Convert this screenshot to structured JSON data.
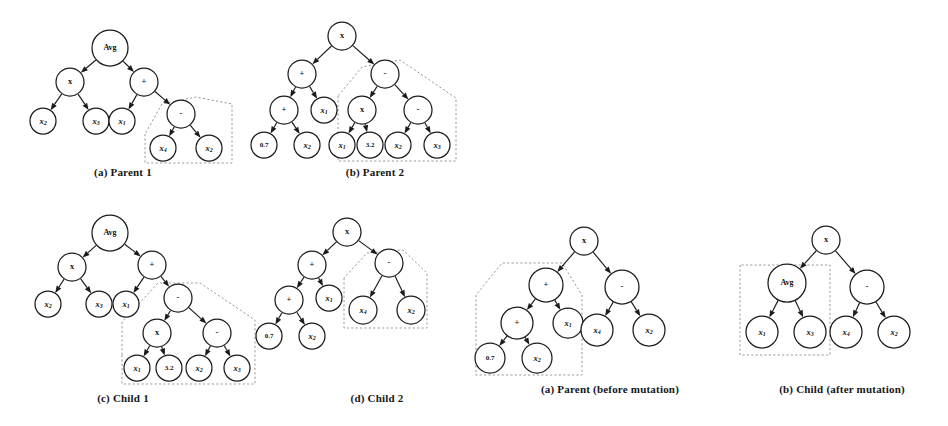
{
  "figures": [
    {
      "id": "parent-1",
      "caption": "(a) Parent 1",
      "caption_x": 58,
      "caption_y": 166,
      "caption_w": 130,
      "x": 0,
      "y": 0,
      "w": 250,
      "h": 165,
      "nodes": [
        {
          "id": "n0",
          "label": "Avg",
          "kind": "word",
          "cx": 110,
          "cy": 48,
          "r": 18
        },
        {
          "id": "n1",
          "label": "x",
          "kind": "op",
          "cx": 70,
          "cy": 82,
          "r": 14
        },
        {
          "id": "n2",
          "label": "+",
          "kind": "op",
          "cx": 144,
          "cy": 82,
          "r": 14
        },
        {
          "id": "n3",
          "label": "x",
          "sub": "2",
          "kind": "var",
          "cx": 43,
          "cy": 121,
          "r": 13
        },
        {
          "id": "n4",
          "label": "x",
          "sub": "3",
          "kind": "var",
          "cx": 96,
          "cy": 121,
          "r": 13
        },
        {
          "id": "n5",
          "label": "x",
          "sub": "1",
          "kind": "var",
          "cx": 122,
          "cy": 121,
          "r": 13
        },
        {
          "id": "n6",
          "label": "-",
          "kind": "op",
          "cx": 181,
          "cy": 114,
          "r": 14
        },
        {
          "id": "n7",
          "label": "x",
          "sub": "4",
          "kind": "var",
          "cx": 163,
          "cy": 148,
          "r": 13
        },
        {
          "id": "n8",
          "label": "x",
          "sub": "2",
          "kind": "var",
          "cx": 209,
          "cy": 148,
          "r": 13
        }
      ],
      "edges": [
        [
          "n0",
          "n1"
        ],
        [
          "n0",
          "n2"
        ],
        [
          "n1",
          "n3"
        ],
        [
          "n1",
          "n4"
        ],
        [
          "n2",
          "n5"
        ],
        [
          "n2",
          "n6"
        ],
        [
          "n6",
          "n7"
        ],
        [
          "n6",
          "n8"
        ]
      ],
      "dashed": [
        {
          "points": "145,134 145,163 232,163 232,104 196,97 162,104 145,134"
        }
      ]
    },
    {
      "id": "parent-2",
      "caption": "(b) Parent 2",
      "caption_x": 310,
      "caption_y": 166,
      "caption_w": 130,
      "x": 250,
      "y": 0,
      "w": 250,
      "h": 165,
      "nodes": [
        {
          "id": "n0",
          "label": "x",
          "kind": "op",
          "cx": 92,
          "cy": 36,
          "r": 14
        },
        {
          "id": "n1",
          "label": "+",
          "kind": "op",
          "cx": 52,
          "cy": 74,
          "r": 14
        },
        {
          "id": "n2",
          "label": "-",
          "kind": "op",
          "cx": 135,
          "cy": 74,
          "r": 14
        },
        {
          "id": "n3",
          "label": "+",
          "kind": "op",
          "cx": 34,
          "cy": 110,
          "r": 14
        },
        {
          "id": "n4",
          "label": "x",
          "sub": "1",
          "kind": "var",
          "cx": 74,
          "cy": 110,
          "r": 13
        },
        {
          "id": "n5",
          "label": "x",
          "kind": "op",
          "cx": 112,
          "cy": 110,
          "r": 14
        },
        {
          "id": "n6",
          "label": "-",
          "kind": "op",
          "cx": 168,
          "cy": 110,
          "r": 14
        },
        {
          "id": "n7",
          "label": "0.7",
          "kind": "num",
          "cx": 14,
          "cy": 145,
          "r": 13
        },
        {
          "id": "n8",
          "label": "x",
          "sub": "2",
          "kind": "var",
          "cx": 57,
          "cy": 145,
          "r": 13
        },
        {
          "id": "n9",
          "label": "x",
          "sub": "1",
          "kind": "var",
          "cx": 92,
          "cy": 145,
          "r": 13
        },
        {
          "id": "n10",
          "label": "3.2",
          "kind": "num",
          "cx": 120,
          "cy": 145,
          "r": 13
        },
        {
          "id": "n11",
          "label": "x",
          "sub": "2",
          "kind": "var",
          "cx": 148,
          "cy": 145,
          "r": 13
        },
        {
          "id": "n12",
          "label": "x",
          "sub": "3",
          "kind": "var",
          "cx": 187,
          "cy": 145,
          "r": 13
        }
      ],
      "edges": [
        [
          "n0",
          "n1"
        ],
        [
          "n0",
          "n2"
        ],
        [
          "n1",
          "n3"
        ],
        [
          "n1",
          "n4"
        ],
        [
          "n2",
          "n5"
        ],
        [
          "n2",
          "n6"
        ],
        [
          "n3",
          "n7"
        ],
        [
          "n3",
          "n8"
        ],
        [
          "n5",
          "n9"
        ],
        [
          "n5",
          "n10"
        ],
        [
          "n6",
          "n11"
        ],
        [
          "n6",
          "n12"
        ]
      ],
      "dashed": [
        {
          "points": "88,96 88,161 206,161 206,98 150,60 112,67 88,96"
        }
      ]
    },
    {
      "id": "child-1",
      "caption": "(c) Child  1",
      "caption_x": 58,
      "caption_y": 392,
      "caption_w": 130,
      "x": 0,
      "y": 205,
      "w": 260,
      "h": 180,
      "nodes": [
        {
          "id": "n0",
          "label": "Avg",
          "kind": "word",
          "cx": 110,
          "cy": 28,
          "r": 18
        },
        {
          "id": "n1",
          "label": "x",
          "kind": "op",
          "cx": 72,
          "cy": 62,
          "r": 14
        },
        {
          "id": "n2",
          "label": "+",
          "kind": "op",
          "cx": 152,
          "cy": 60,
          "r": 14
        },
        {
          "id": "n3",
          "label": "x",
          "sub": "2",
          "kind": "var",
          "cx": 48,
          "cy": 99,
          "r": 13
        },
        {
          "id": "n4",
          "label": "x",
          "sub": "3",
          "kind": "var",
          "cx": 99,
          "cy": 99,
          "r": 13
        },
        {
          "id": "n5",
          "label": "x",
          "sub": "1",
          "kind": "var",
          "cx": 126,
          "cy": 99,
          "r": 13
        },
        {
          "id": "n6",
          "label": "-",
          "kind": "op",
          "cx": 178,
          "cy": 93,
          "r": 14
        },
        {
          "id": "n7",
          "label": "x",
          "kind": "op",
          "cx": 157,
          "cy": 128,
          "r": 14
        },
        {
          "id": "n8",
          "label": "-",
          "kind": "op",
          "cx": 217,
          "cy": 128,
          "r": 14
        },
        {
          "id": "n9",
          "label": "x",
          "sub": "1",
          "kind": "var",
          "cx": 137,
          "cy": 163,
          "r": 13
        },
        {
          "id": "n10",
          "label": "3.2",
          "kind": "num",
          "cx": 169,
          "cy": 163,
          "r": 13
        },
        {
          "id": "n11",
          "label": "x",
          "sub": "2",
          "kind": "var",
          "cx": 199,
          "cy": 163,
          "r": 13
        },
        {
          "id": "n12",
          "label": "x",
          "sub": "3",
          "kind": "var",
          "cx": 237,
          "cy": 163,
          "r": 13
        }
      ],
      "edges": [
        [
          "n0",
          "n1"
        ],
        [
          "n0",
          "n2"
        ],
        [
          "n1",
          "n3"
        ],
        [
          "n1",
          "n4"
        ],
        [
          "n2",
          "n5"
        ],
        [
          "n2",
          "n6"
        ],
        [
          "n6",
          "n7"
        ],
        [
          "n6",
          "n8"
        ],
        [
          "n7",
          "n9"
        ],
        [
          "n7",
          "n10"
        ],
        [
          "n8",
          "n11"
        ],
        [
          "n8",
          "n12"
        ]
      ],
      "dashed": [
        {
          "points": "122,150 122,179 255,179 255,115 200,78 158,78 122,117 122,150"
        }
      ]
    },
    {
      "id": "child-2",
      "caption": "(d) Child 2",
      "caption_x": 312,
      "caption_y": 392,
      "caption_w": 130,
      "x": 255,
      "y": 205,
      "w": 245,
      "h": 180,
      "nodes": [
        {
          "id": "n0",
          "label": "x",
          "kind": "op",
          "cx": 92,
          "cy": 27,
          "r": 14
        },
        {
          "id": "n1",
          "label": "+",
          "kind": "op",
          "cx": 57,
          "cy": 60,
          "r": 14
        },
        {
          "id": "n2",
          "label": "-",
          "kind": "op",
          "cx": 134,
          "cy": 58,
          "r": 14
        },
        {
          "id": "n3",
          "label": "+",
          "kind": "op",
          "cx": 34,
          "cy": 95,
          "r": 14
        },
        {
          "id": "n4",
          "label": "x",
          "sub": "1",
          "kind": "var",
          "cx": 74,
          "cy": 93,
          "r": 13
        },
        {
          "id": "n5",
          "label": "x",
          "sub": "4",
          "kind": "var",
          "cx": 108,
          "cy": 105,
          "r": 14
        },
        {
          "id": "n6",
          "label": "x",
          "sub": "2",
          "kind": "var",
          "cx": 156,
          "cy": 105,
          "r": 14
        },
        {
          "id": "n7",
          "label": "0.7",
          "kind": "num",
          "cx": 14,
          "cy": 131,
          "r": 13
        },
        {
          "id": "n8",
          "label": "x",
          "sub": "2",
          "kind": "var",
          "cx": 57,
          "cy": 131,
          "r": 13
        }
      ],
      "edges": [
        [
          "n0",
          "n1"
        ],
        [
          "n0",
          "n2"
        ],
        [
          "n1",
          "n3"
        ],
        [
          "n1",
          "n4"
        ],
        [
          "n2",
          "n5"
        ],
        [
          "n2",
          "n6"
        ],
        [
          "n3",
          "n7"
        ],
        [
          "n3",
          "n8"
        ]
      ],
      "dashed": [
        {
          "points": "89,73 89,123 172,123 172,68 148,45 112,48 89,73"
        }
      ]
    },
    {
      "id": "mutation-parent",
      "caption": "(a) Parent (before mutation)",
      "caption_x": 510,
      "caption_y": 383,
      "caption_w": 200,
      "x": 492,
      "y": 215,
      "w": 230,
      "h": 170,
      "nodes": [
        {
          "id": "n0",
          "label": "x",
          "kind": "op",
          "cx": 92,
          "cy": 26,
          "r": 14
        },
        {
          "id": "n1",
          "label": "+",
          "kind": "op",
          "cx": 54,
          "cy": 70,
          "r": 17
        },
        {
          "id": "n2",
          "label": "-",
          "kind": "op",
          "cx": 130,
          "cy": 72,
          "r": 17
        },
        {
          "id": "n3",
          "label": "+",
          "kind": "op",
          "cx": 25,
          "cy": 108,
          "r": 16
        },
        {
          "id": "n4",
          "label": "x",
          "sub": "1",
          "kind": "var",
          "cx": 76,
          "cy": 108,
          "r": 15
        },
        {
          "id": "n5",
          "label": "x",
          "sub": "4",
          "kind": "var",
          "cx": 105,
          "cy": 115,
          "r": 16
        },
        {
          "id": "n6",
          "label": "x",
          "sub": "2",
          "kind": "var",
          "cx": 157,
          "cy": 115,
          "r": 16
        },
        {
          "id": "n7",
          "label": "0.7",
          "kind": "num",
          "cx": -2,
          "cy": 143,
          "r": 15
        },
        {
          "id": "n8",
          "label": "x",
          "sub": "2",
          "kind": "var",
          "cx": 45,
          "cy": 143,
          "r": 15
        }
      ],
      "edges": [
        [
          "n0",
          "n1"
        ],
        [
          "n0",
          "n2"
        ],
        [
          "n1",
          "n3"
        ],
        [
          "n1",
          "n4"
        ],
        [
          "n2",
          "n5"
        ],
        [
          "n2",
          "n6"
        ],
        [
          "n3",
          "n7"
        ],
        [
          "n3",
          "n8"
        ]
      ],
      "dashed": [
        {
          "points": "-16,80 -16,160 90,160 90,80 70,48 10,48 -16,80"
        }
      ]
    },
    {
      "id": "mutation-child",
      "caption": "(b) Child (after mutation)",
      "caption_x": 742,
      "caption_y": 383,
      "caption_w": 200,
      "x": 722,
      "y": 215,
      "w": 226,
      "h": 170,
      "nodes": [
        {
          "id": "n0",
          "label": "x",
          "kind": "op",
          "cx": 104,
          "cy": 25,
          "r": 14
        },
        {
          "id": "n1",
          "label": "Avg",
          "kind": "word",
          "cx": 65,
          "cy": 68,
          "r": 19
        },
        {
          "id": "n2",
          "label": "-",
          "kind": "op",
          "cx": 145,
          "cy": 72,
          "r": 17
        },
        {
          "id": "n3",
          "label": "x",
          "sub": "1",
          "kind": "var",
          "cx": 40,
          "cy": 117,
          "r": 16
        },
        {
          "id": "n4",
          "label": "x",
          "sub": "3",
          "kind": "var",
          "cx": 88,
          "cy": 117,
          "r": 16
        },
        {
          "id": "n5",
          "label": "x",
          "sub": "4",
          "kind": "var",
          "cx": 124,
          "cy": 117,
          "r": 16
        },
        {
          "id": "n6",
          "label": "x",
          "sub": "2",
          "kind": "var",
          "cx": 172,
          "cy": 117,
          "r": 16
        }
      ],
      "edges": [
        [
          "n0",
          "n1"
        ],
        [
          "n0",
          "n2"
        ],
        [
          "n1",
          "n3"
        ],
        [
          "n1",
          "n4"
        ],
        [
          "n2",
          "n5"
        ],
        [
          "n2",
          "n6"
        ]
      ],
      "dashed": [
        {
          "points": "18,50 18,140 108,140 108,50 18,50"
        }
      ]
    }
  ]
}
